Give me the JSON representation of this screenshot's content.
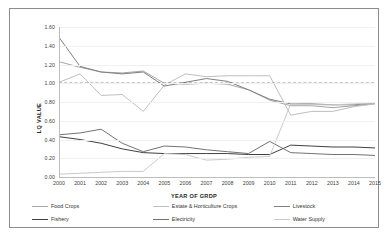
{
  "chart_data": {
    "type": "line",
    "title": "",
    "xlabel": "YEAR OF GRDP",
    "ylabel": "LQ VALUE",
    "x": [
      2000,
      2001,
      2002,
      2003,
      2004,
      2005,
      2006,
      2007,
      2008,
      2009,
      2010,
      2011,
      2012,
      2013,
      2014,
      2015
    ],
    "xtick_labels": [
      "2000",
      "2001",
      "2002",
      "2003",
      "2004",
      "2005",
      "2006",
      "2007",
      "2008",
      "2009",
      "2010",
      "2011",
      "2012",
      "2013",
      "2014",
      "2015"
    ],
    "ytick_labels": [
      "0.00",
      "0.20",
      "0.40",
      "0.60",
      "0.80",
      "1.00",
      "1.20",
      "1.40",
      "1.60"
    ],
    "ytick_values": [
      0.0,
      0.2,
      0.4,
      0.6,
      0.8,
      1.0,
      1.2,
      1.4,
      1.6
    ],
    "ylim": [
      0.0,
      1.6
    ],
    "xlim": [
      2000,
      2015
    ],
    "grid": false,
    "legend_position": "bottom",
    "reference_line": {
      "value": 1.0,
      "style": "dashed",
      "color": "#262626"
    },
    "series": [
      {
        "name": "Food Crops",
        "color": "#a6a6a6",
        "values": [
          1.23,
          1.17,
          1.12,
          1.11,
          1.13,
          1.0,
          0.99,
          1.0,
          0.99,
          0.93,
          0.82,
          0.76,
          0.76,
          0.74,
          0.76,
          0.78
        ]
      },
      {
        "name": "Estate & Horticulture Crops",
        "color": "#bfbfbf",
        "values": [
          1.01,
          1.1,
          0.87,
          0.88,
          0.7,
          0.98,
          1.1,
          1.07,
          1.08,
          1.08,
          1.08,
          0.66,
          0.7,
          0.7,
          0.75,
          0.78
        ]
      },
      {
        "name": "Livestock",
        "color": "#808080",
        "values": [
          1.49,
          1.18,
          1.12,
          1.1,
          1.12,
          0.97,
          1.01,
          1.05,
          1.02,
          0.93,
          0.83,
          0.78,
          0.78,
          0.77,
          0.77,
          0.79
        ]
      },
      {
        "name": "Fishery",
        "color": "#404040",
        "values": [
          0.43,
          0.4,
          0.36,
          0.3,
          0.26,
          0.25,
          0.25,
          0.25,
          0.25,
          0.24,
          0.24,
          0.34,
          0.33,
          0.32,
          0.32,
          0.31
        ]
      },
      {
        "name": "Electricity",
        "color": "#737373",
        "values": [
          0.45,
          0.47,
          0.51,
          0.36,
          0.27,
          0.33,
          0.32,
          0.29,
          0.27,
          0.25,
          0.38,
          0.26,
          0.25,
          0.24,
          0.24,
          0.23
        ]
      },
      {
        "name": "Water Supply",
        "color": "#c9c9c9",
        "values": [
          0.03,
          0.04,
          0.05,
          0.06,
          0.06,
          0.25,
          0.24,
          0.18,
          0.19,
          0.21,
          0.22,
          0.78,
          0.77,
          0.77,
          0.78,
          0.79
        ]
      }
    ]
  },
  "legend": {
    "items": [
      {
        "label": "Food Crops",
        "color": "#a6a6a6"
      },
      {
        "label": "Estate & Horticulture Crops",
        "color": "#bfbfbf"
      },
      {
        "label": "Livestock",
        "color": "#808080"
      },
      {
        "label": "Fishery",
        "color": "#404040"
      },
      {
        "label": "Electricity",
        "color": "#737373"
      },
      {
        "label": "Water Supply",
        "color": "#c9c9c9"
      }
    ]
  }
}
